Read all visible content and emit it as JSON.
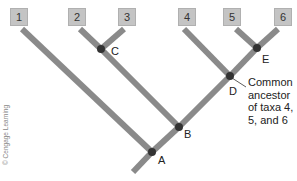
{
  "diagram": {
    "type": "phylogenetic-tree",
    "taxa": [
      {
        "id": "1",
        "label": "1",
        "x": 19
      },
      {
        "id": "2",
        "label": "2",
        "x": 77
      },
      {
        "id": "3",
        "label": "3",
        "x": 127
      },
      {
        "id": "4",
        "label": "4",
        "x": 187
      },
      {
        "id": "5",
        "label": "5",
        "x": 232
      },
      {
        "id": "6",
        "label": "6",
        "x": 283
      }
    ],
    "nodes": [
      {
        "id": "A",
        "label": "A"
      },
      {
        "id": "B",
        "label": "B"
      },
      {
        "id": "C",
        "label": "C"
      },
      {
        "id": "D",
        "label": "D"
      },
      {
        "id": "E",
        "label": "E"
      }
    ],
    "annotation": {
      "target_node": "D",
      "lines": [
        "Common",
        "ancestor",
        "of taxa 4,",
        "5, and 6"
      ]
    },
    "credit": "© Cengage Learning",
    "colors": {
      "branch": "#8a8a8a",
      "node": "#333333",
      "box": "#c4c4c4"
    }
  }
}
